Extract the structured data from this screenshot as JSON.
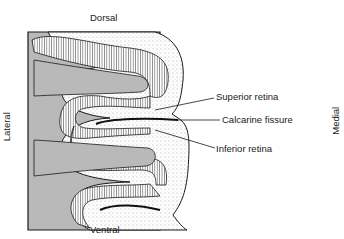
{
  "diagram": {
    "title": "",
    "orientation": {
      "top": "Dorsal",
      "bottom": "Ventral",
      "left": "Lateral",
      "right": "Medial"
    },
    "labels": {
      "superior_retina": "Superior retina",
      "calcarine_fissure": "Calcarine fissure",
      "inferior_retina": "Inferior retina"
    },
    "colors": {
      "white_matter": "#b9b9b9",
      "cortex_fill": "#f2f2f2",
      "outline": "#1a1a1a"
    }
  }
}
